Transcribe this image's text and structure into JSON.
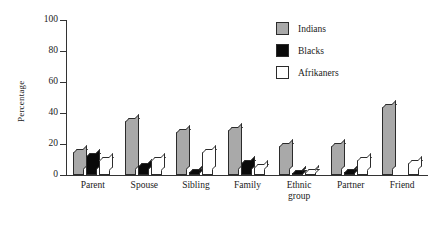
{
  "chart_data": {
    "type": "bar",
    "title": "",
    "xlabel": "",
    "ylabel": "Percentage",
    "ylim": [
      0,
      100
    ],
    "yticks": [
      0,
      20,
      40,
      60,
      80,
      100
    ],
    "grid": false,
    "legend_position": "top-right",
    "categories": [
      "Parent",
      "Spouse",
      "Sibling",
      "Family",
      "Ethnic group",
      "Partner",
      "Friend"
    ],
    "series": [
      {
        "name": "Indians",
        "color": "#a9a9a9",
        "values": [
          15,
          35,
          28,
          29,
          19,
          19,
          44
        ]
      },
      {
        "name": "Blacks",
        "color": "#0a0a0a",
        "values": [
          12,
          6,
          2,
          8,
          1,
          2,
          0
        ]
      },
      {
        "name": "Afrikaners",
        "color": "#ffffff",
        "values": [
          10,
          10,
          15,
          5,
          2,
          10,
          8
        ]
      }
    ]
  },
  "axis": {
    "y_label": "Percentage",
    "y_ticks": [
      "100",
      "80",
      "60",
      "40",
      "20",
      "0"
    ]
  },
  "legend": {
    "items": [
      {
        "label": "Indians"
      },
      {
        "label": "Blacks"
      },
      {
        "label": "Afrikaners"
      }
    ]
  },
  "xaxis": {
    "labels": [
      {
        "line1": "Parent",
        "line2": ""
      },
      {
        "line1": "Spouse",
        "line2": ""
      },
      {
        "line1": "Sibling",
        "line2": ""
      },
      {
        "line1": "Family",
        "line2": ""
      },
      {
        "line1": "Ethnic",
        "line2": "group"
      },
      {
        "line1": "Partner",
        "line2": ""
      },
      {
        "line1": "Friend",
        "line2": ""
      }
    ]
  }
}
